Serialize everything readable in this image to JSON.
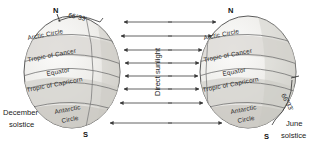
{
  "figure": {
    "background_color": "#ffffff",
    "globe_fill": "#f0efed",
    "globe_shade_fill": "#d9d7d3",
    "line_color": "#5a5a5a",
    "text_color": "#1f1f1f"
  },
  "sunlight": {
    "label": "Direct sunlight",
    "arrow_count_left": 8,
    "arrow_count_right": 8,
    "left_direction": "left",
    "right_direction": "right"
  },
  "globes": [
    {
      "id": "december-globe",
      "solstice_label_line1": "December",
      "solstice_label_line2": "solstice",
      "north_pole": "N",
      "south_pole": "S",
      "axis_angle_label": "66°33'",
      "latitudes": [
        {
          "name": "arctic-circle",
          "label": "Arctic Circle",
          "lines": [
            "Arctic Circle"
          ]
        },
        {
          "name": "tropic-of-cancer",
          "label": "Tropic of Cancer",
          "lines": [
            "Tropic of Cancer"
          ]
        },
        {
          "name": "equator",
          "label": "Equator",
          "lines": [
            "Equator"
          ]
        },
        {
          "name": "tropic-of-capricorn",
          "label": "Tropic of Capricorn",
          "lines": [
            "Tropic of Capricorn"
          ]
        },
        {
          "name": "antarctic-circle",
          "label": "Antarctic Circle",
          "lines": [
            "Antarctic",
            "Circle"
          ]
        }
      ]
    },
    {
      "id": "june-globe",
      "solstice_label_line1": "June",
      "solstice_label_line2": "solstice",
      "north_pole": "N",
      "south_pole": "S",
      "axis_angle_label": "66°33'",
      "latitudes": [
        {
          "name": "arctic-circle",
          "label": "Arctic Circle",
          "lines": [
            "Arctic Circle"
          ]
        },
        {
          "name": "tropic-of-cancer",
          "label": "Tropic of Cancer",
          "lines": [
            "Tropic of Cancer"
          ]
        },
        {
          "name": "equator",
          "label": "Equator",
          "lines": [
            "Equator"
          ]
        },
        {
          "name": "tropic-of-capricorn",
          "label": "Tropic of Capricorn",
          "lines": [
            "Tropic of Capricorn"
          ]
        },
        {
          "name": "antarctic-circle",
          "label": "Antarctic Circle",
          "lines": [
            "Antarctic",
            "Circle"
          ]
        }
      ]
    }
  ]
}
